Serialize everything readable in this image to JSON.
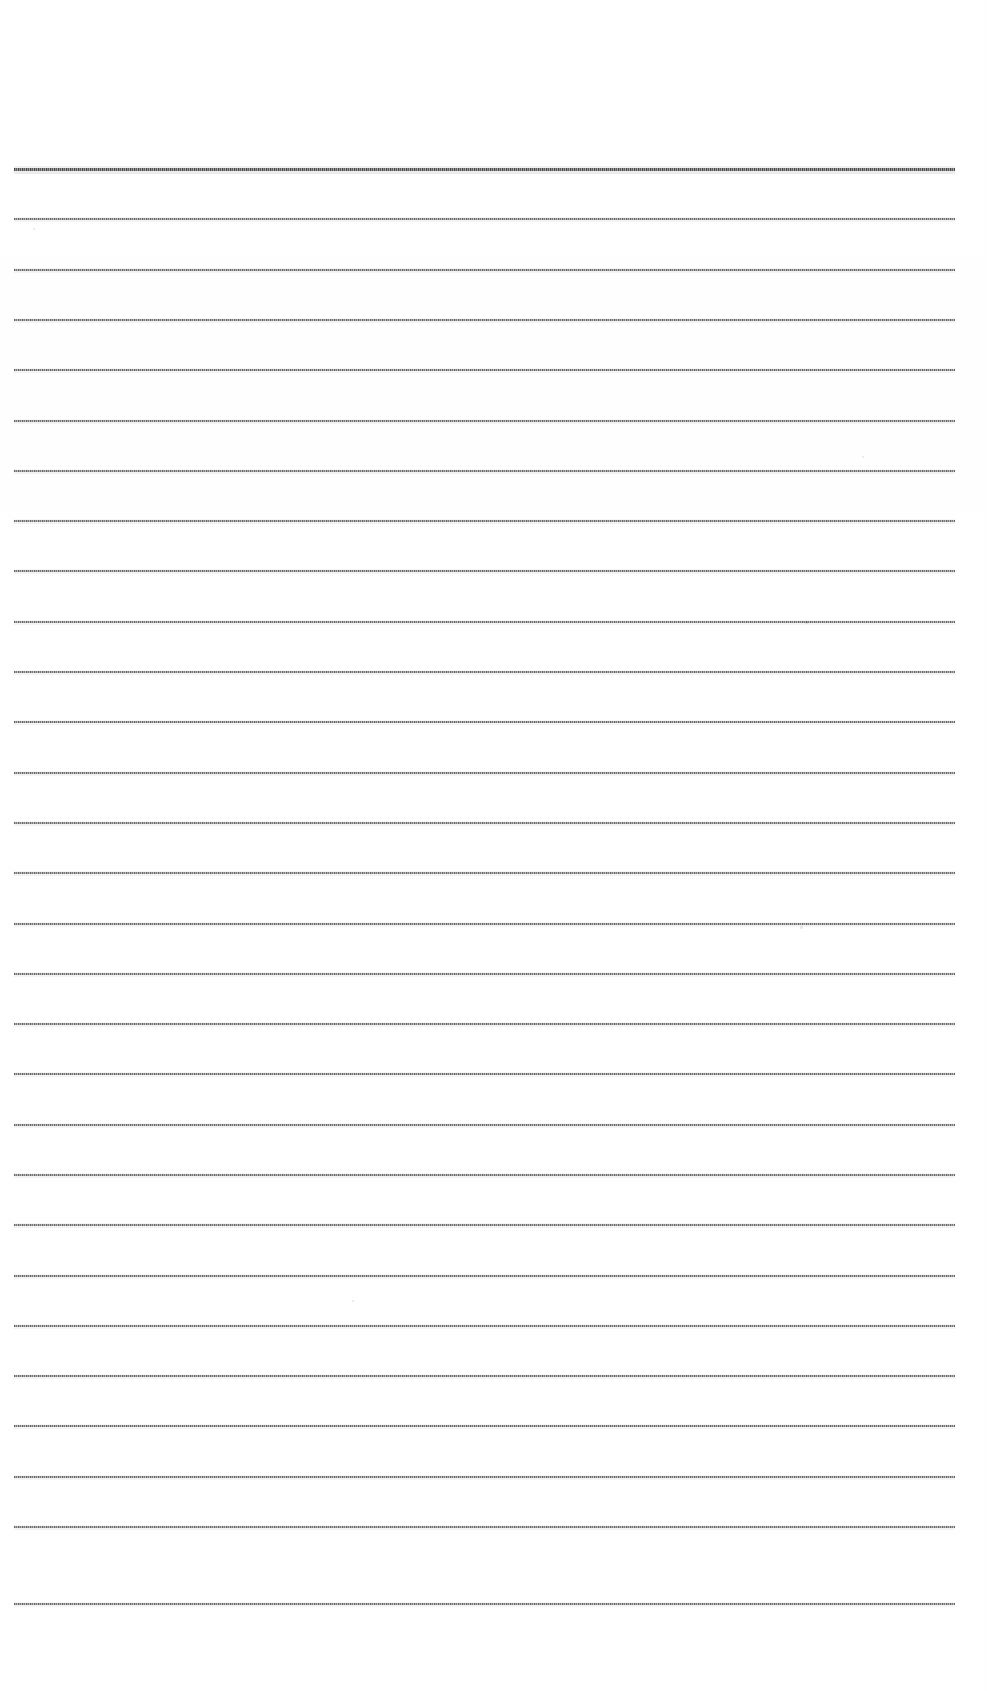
{
  "document": {
    "kind": "scanned-ruled-paper",
    "title": "Blank ruled writing paper (scan)",
    "page_width": 987,
    "page_height": 1691,
    "background_color": "#ffffff",
    "written_content": "",
    "visible_text": ""
  },
  "sheet": {
    "rule_color": "#6b6b6b",
    "heavy_rule_color": "#4a4a4a",
    "left_margin_px": 14,
    "right_edge_px": 955,
    "rule_length_px": 941,
    "first_rule_y": 168,
    "line_spacing_px": 50.2,
    "rule_count": 29,
    "top_margin_px": 168,
    "bottom_margin_px": 88
  },
  "rules": [
    {
      "index": 1,
      "y": 168,
      "thickness": 3,
      "weight": "heavy",
      "left": 14,
      "width": 941
    },
    {
      "index": 2,
      "y": 218,
      "thickness": 2,
      "weight": "normal",
      "left": 14,
      "width": 941
    },
    {
      "index": 3,
      "y": 269,
      "thickness": 2,
      "weight": "normal",
      "left": 14,
      "width": 941
    },
    {
      "index": 4,
      "y": 319,
      "thickness": 2,
      "weight": "normal",
      "left": 14,
      "width": 941
    },
    {
      "index": 5,
      "y": 369,
      "thickness": 2,
      "weight": "normal",
      "left": 14,
      "width": 941
    },
    {
      "index": 6,
      "y": 420,
      "thickness": 2,
      "weight": "normal",
      "left": 14,
      "width": 941
    },
    {
      "index": 7,
      "y": 470,
      "thickness": 2,
      "weight": "normal",
      "left": 14,
      "width": 941
    },
    {
      "index": 8,
      "y": 520,
      "thickness": 2,
      "weight": "normal",
      "left": 14,
      "width": 941
    },
    {
      "index": 9,
      "y": 570,
      "thickness": 2,
      "weight": "normal",
      "left": 14,
      "width": 941
    },
    {
      "index": 10,
      "y": 621,
      "thickness": 2,
      "weight": "normal",
      "left": 14,
      "width": 941
    },
    {
      "index": 11,
      "y": 671,
      "thickness": 2,
      "weight": "normal",
      "left": 14,
      "width": 941
    },
    {
      "index": 12,
      "y": 721,
      "thickness": 2,
      "weight": "normal",
      "left": 14,
      "width": 941
    },
    {
      "index": 13,
      "y": 772,
      "thickness": 2,
      "weight": "normal",
      "left": 14,
      "width": 941
    },
    {
      "index": 14,
      "y": 822,
      "thickness": 2,
      "weight": "normal",
      "left": 14,
      "width": 941
    },
    {
      "index": 15,
      "y": 872,
      "thickness": 2,
      "weight": "normal",
      "left": 14,
      "width": 941
    },
    {
      "index": 16,
      "y": 923,
      "thickness": 2,
      "weight": "normal",
      "left": 14,
      "width": 941
    },
    {
      "index": 17,
      "y": 973,
      "thickness": 2,
      "weight": "normal",
      "left": 14,
      "width": 941
    },
    {
      "index": 18,
      "y": 1023,
      "thickness": 2,
      "weight": "normal",
      "left": 14,
      "width": 941
    },
    {
      "index": 19,
      "y": 1073,
      "thickness": 2,
      "weight": "normal",
      "left": 14,
      "width": 941
    },
    {
      "index": 20,
      "y": 1124,
      "thickness": 2,
      "weight": "normal",
      "left": 14,
      "width": 941
    },
    {
      "index": 21,
      "y": 1174,
      "thickness": 2,
      "weight": "normal",
      "left": 14,
      "width": 941
    },
    {
      "index": 22,
      "y": 1224,
      "thickness": 2,
      "weight": "normal",
      "left": 14,
      "width": 941
    },
    {
      "index": 23,
      "y": 1275,
      "thickness": 2,
      "weight": "normal",
      "left": 14,
      "width": 941
    },
    {
      "index": 24,
      "y": 1325,
      "thickness": 2,
      "weight": "normal",
      "left": 14,
      "width": 941
    },
    {
      "index": 25,
      "y": 1375,
      "thickness": 2,
      "weight": "normal",
      "left": 14,
      "width": 941
    },
    {
      "index": 26,
      "y": 1425,
      "thickness": 2,
      "weight": "normal",
      "left": 14,
      "width": 941
    },
    {
      "index": 27,
      "y": 1476,
      "thickness": 2,
      "weight": "normal",
      "left": 14,
      "width": 941
    },
    {
      "index": 28,
      "y": 1526,
      "thickness": 2,
      "weight": "normal",
      "left": 14,
      "width": 941
    },
    {
      "index": 29,
      "y": 1603,
      "thickness": 2,
      "weight": "normal",
      "left": 14,
      "width": 941
    }
  ],
  "specks": [
    {
      "x": 805,
      "y": 621,
      "size": 3
    },
    {
      "x": 800,
      "y": 926,
      "size": 3
    },
    {
      "x": 33,
      "y": 228,
      "size": 2
    },
    {
      "x": 352,
      "y": 1300,
      "size": 2
    },
    {
      "x": 862,
      "y": 456,
      "size": 2
    }
  ]
}
